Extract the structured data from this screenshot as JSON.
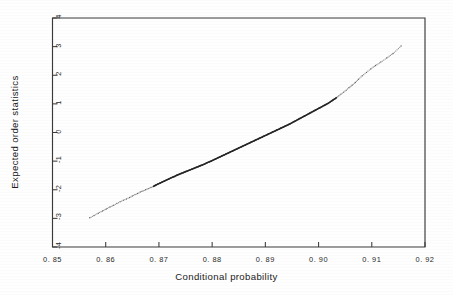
{
  "figure": {
    "background_color": "#ffffff",
    "ink_color": "#222222"
  },
  "chart_data": {
    "type": "scatter",
    "title": "",
    "xlabel": "Conditional probability",
    "ylabel": "Expected order statistics",
    "xlim": [
      0.85,
      0.92
    ],
    "ylim": [
      -4,
      4
    ],
    "grid": false,
    "legend": null,
    "xticks": [
      0.85,
      0.86,
      0.87,
      0.88,
      0.89,
      0.9,
      0.91,
      0.92
    ],
    "xticklabels": [
      "0. 85",
      "0. 86",
      "0. 87",
      "0. 88",
      "0. 89",
      "0. 90",
      "0. 91",
      "0. 92"
    ],
    "yticks": [
      4,
      3,
      2,
      1,
      0,
      -1,
      -2,
      -3,
      -4
    ],
    "yticklabels": [
      "4",
      "3",
      "2",
      "1",
      "0",
      "-1",
      "-2",
      "-3",
      "-4"
    ],
    "marker": "dot",
    "marker_size": 1.1,
    "series": [
      {
        "name": "normal probability plot",
        "x": [
          0.857,
          0.8578,
          0.8586,
          0.8594,
          0.8601,
          0.8608,
          0.8615,
          0.8621,
          0.8627,
          0.8633,
          0.8639,
          0.8645,
          0.865,
          0.8655,
          0.866,
          0.8665,
          0.867,
          0.8675,
          0.868,
          0.8685,
          0.869,
          0.8694,
          0.8698,
          0.8702,
          0.8706,
          0.871,
          0.8714,
          0.8718,
          0.8722,
          0.8726,
          0.873,
          0.8734,
          0.8738,
          0.8742,
          0.8746,
          0.875,
          0.8754,
          0.8758,
          0.8762,
          0.8766,
          0.877,
          0.8774,
          0.8778,
          0.8782,
          0.8786,
          0.879,
          0.8794,
          0.8798,
          0.8802,
          0.8806,
          0.881,
          0.8814,
          0.8818,
          0.8822,
          0.8826,
          0.883,
          0.8834,
          0.8838,
          0.8842,
          0.8846,
          0.885,
          0.8854,
          0.8858,
          0.8862,
          0.8866,
          0.887,
          0.8874,
          0.8878,
          0.8882,
          0.8886,
          0.889,
          0.8894,
          0.8898,
          0.8902,
          0.8906,
          0.891,
          0.8914,
          0.8918,
          0.8922,
          0.8926,
          0.893,
          0.8934,
          0.8938,
          0.8942,
          0.8946,
          0.895,
          0.8954,
          0.8958,
          0.8962,
          0.8966,
          0.897,
          0.8974,
          0.8978,
          0.8982,
          0.8986,
          0.899,
          0.8994,
          0.8998,
          0.9002,
          0.9006,
          0.901,
          0.9014,
          0.9018,
          0.9022,
          0.9026,
          0.903,
          0.9034,
          0.9038,
          0.9042,
          0.9047,
          0.9052,
          0.9057,
          0.9063,
          0.9069,
          0.9075,
          0.9082,
          0.909,
          0.9098,
          0.9107,
          0.9117,
          0.9128,
          0.914,
          0.9155
        ],
        "y": [
          -2.98,
          -2.9,
          -2.82,
          -2.74,
          -2.67,
          -2.6,
          -2.54,
          -2.48,
          -2.42,
          -2.37,
          -2.32,
          -2.27,
          -2.22,
          -2.17,
          -2.13,
          -2.08,
          -2.04,
          -2.0,
          -1.96,
          -1.92,
          -1.88,
          -1.84,
          -1.8,
          -1.77,
          -1.73,
          -1.7,
          -1.66,
          -1.63,
          -1.59,
          -1.56,
          -1.53,
          -1.49,
          -1.46,
          -1.43,
          -1.4,
          -1.37,
          -1.34,
          -1.31,
          -1.28,
          -1.25,
          -1.22,
          -1.19,
          -1.16,
          -1.13,
          -1.1,
          -1.06,
          -1.03,
          -1.0,
          -0.96,
          -0.93,
          -0.89,
          -0.86,
          -0.82,
          -0.79,
          -0.75,
          -0.72,
          -0.68,
          -0.65,
          -0.61,
          -0.58,
          -0.54,
          -0.51,
          -0.47,
          -0.44,
          -0.4,
          -0.37,
          -0.33,
          -0.3,
          -0.26,
          -0.23,
          -0.19,
          -0.16,
          -0.12,
          -0.09,
          -0.05,
          -0.02,
          0.02,
          0.05,
          0.09,
          0.12,
          0.16,
          0.19,
          0.23,
          0.26,
          0.3,
          0.34,
          0.38,
          0.42,
          0.46,
          0.5,
          0.54,
          0.58,
          0.62,
          0.66,
          0.7,
          0.74,
          0.78,
          0.82,
          0.86,
          0.9,
          0.94,
          0.98,
          1.02,
          1.07,
          1.12,
          1.17,
          1.22,
          1.28,
          1.34,
          1.41,
          1.48,
          1.56,
          1.65,
          1.75,
          1.86,
          1.98,
          2.1,
          2.22,
          2.34,
          2.46,
          2.6,
          2.76,
          3.02
        ],
        "dense_x_range": [
          0.869,
          0.903
        ],
        "description": "Monotone increasing normal probability plot; sparse dots in both tails, dense nearly-solid line in the central region."
      }
    ]
  }
}
